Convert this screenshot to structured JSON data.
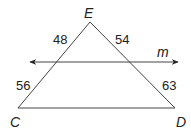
{
  "diagram": {
    "vertices": {
      "E": {
        "label": "E",
        "x": 90,
        "y": 22
      },
      "C": {
        "label": "C",
        "x": 18,
        "y": 108
      },
      "D": {
        "label": "D",
        "x": 175,
        "y": 108
      }
    },
    "line_m": {
      "label": "m",
      "y": 62,
      "x1": 30,
      "x2": 178
    },
    "segment_labels": {
      "upper_left": "48",
      "upper_right": "54",
      "lower_left": "56",
      "lower_right": "63"
    },
    "colors": {
      "stroke": "#444444",
      "text": "#222222",
      "background": "#ffffff"
    }
  }
}
